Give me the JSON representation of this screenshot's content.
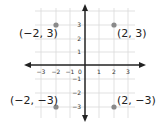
{
  "diagram": {
    "type": "coordinate-plane",
    "x_range": [
      -3,
      3
    ],
    "y_range": [
      -3,
      3
    ],
    "x_ticks": [
      "-3",
      "-2",
      "-1",
      "0",
      "1",
      "2",
      "3"
    ],
    "y_ticks": [
      "-3",
      "-2",
      "-1",
      "1",
      "2",
      "3"
    ],
    "points": [
      {
        "x": -2,
        "y": 3,
        "label": "(−2, 3)"
      },
      {
        "x": 2,
        "y": 3,
        "label": "(2, 3)"
      },
      {
        "x": -2,
        "y": -3,
        "label": "(−2, −3)"
      },
      {
        "x": 2,
        "y": -3,
        "label": "(2, −3)"
      }
    ],
    "colors": {
      "point": "#8a8a8a",
      "axis": "#222222",
      "grid": "#d9d9d9"
    }
  },
  "labels": {
    "tick_x_m3": "−3",
    "tick_x_m2": "−2",
    "tick_x_m1": "−1",
    "tick_x_0": "0",
    "tick_x_1": "1",
    "tick_x_2": "2",
    "tick_x_3": "3",
    "tick_y_3": "3",
    "tick_y_2": "2",
    "tick_y_1": "1",
    "tick_y_m1": "−1",
    "tick_y_m2": "−2",
    "tick_y_m3": "−3",
    "p1": "(−2, 3)",
    "p2": "(2, 3)",
    "p3": "(−2, −3)",
    "p4": "(2, −3)"
  }
}
